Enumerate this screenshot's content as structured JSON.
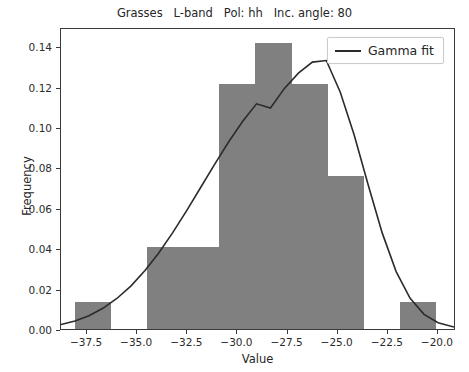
{
  "chart_data": {
    "type": "bar",
    "title": "Grasses   L-band   Pol: hh   Inc. angle: 80",
    "xlabel": "Value",
    "ylabel": "Frequency",
    "xlim": [
      -38.8,
      -19.1
    ],
    "ylim": [
      0.0,
      0.1495
    ],
    "grid": false,
    "legend_position": "upper right",
    "bar_color": "#808080",
    "line_color": "#2b2b2b",
    "bin_edges": [
      -38.1,
      -36.3,
      -34.5,
      -32.7,
      -30.9,
      -29.1,
      -27.3,
      -25.5,
      -23.7,
      -21.9,
      -20.1
    ],
    "bin_centers": [
      -37.2,
      -35.4,
      -33.6,
      -31.8,
      -30.0,
      -28.2,
      -26.4,
      -24.6,
      -22.8,
      -21.0
    ],
    "values": [
      0.0135,
      0.0,
      0.0405,
      0.0405,
      0.1215,
      0.1418,
      0.1215,
      0.0757,
      0.0,
      0.0135
    ],
    "series": [
      {
        "name": "Gamma fit",
        "type": "line",
        "x": [
          -38.8,
          -38.1,
          -37.4,
          -36.7,
          -36.0,
          -35.3,
          -34.6,
          -33.9,
          -33.2,
          -32.5,
          -31.8,
          -31.1,
          -30.4,
          -29.7,
          -29.0,
          -28.3,
          -27.6,
          -26.9,
          -26.2,
          -25.5,
          -24.8,
          -24.1,
          -23.4,
          -22.7,
          -22.0,
          -21.3,
          -20.6,
          -19.9,
          -19.1
        ],
        "y": [
          0.0022,
          0.004,
          0.0066,
          0.0103,
          0.0152,
          0.0214,
          0.029,
          0.0379,
          0.048,
          0.059,
          0.0705,
          0.082,
          0.0932,
          0.1034,
          0.1122,
          0.1101,
          0.1199,
          0.1275,
          0.133,
          0.1338,
          0.118,
          0.0965,
          0.0718,
          0.0479,
          0.0286,
          0.0153,
          0.0073,
          0.0031,
          0.001
        ]
      }
    ],
    "xticks": [
      -37.5,
      -35.0,
      -32.5,
      -30.0,
      -27.5,
      -25.0,
      -22.5,
      -20.0
    ],
    "xticklabels": [
      "−37.5",
      "−35.0",
      "−32.5",
      "−30.0",
      "−27.5",
      "−25.0",
      "−22.5",
      "−20.0"
    ],
    "yticks": [
      0.0,
      0.02,
      0.04,
      0.06,
      0.08,
      0.1,
      0.12,
      0.14
    ],
    "yticklabels": [
      "0.00",
      "0.02",
      "0.04",
      "0.06",
      "0.08",
      "0.10",
      "0.12",
      "0.14"
    ],
    "legend": [
      {
        "label": "Gamma fit",
        "marker": "line",
        "color": "#2b2b2b"
      }
    ]
  }
}
